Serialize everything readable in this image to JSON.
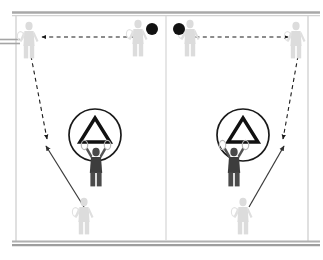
{
  "diagram": {
    "court": {
      "outline_color": "#bdbdbd",
      "boundary_color": "#9a9a9a",
      "top_line_y": 14,
      "bottom_line_y": 241,
      "left_x": 16,
      "right_x": 308,
      "center_line_x": 166,
      "net_stub_y": 41,
      "net_stub_x_end": 20
    },
    "logo": {
      "name": "circle-triangle-logo",
      "shape": "circle-with-hollow-triangle",
      "stroke_color": "#111111",
      "instances": [
        {
          "cx": 95,
          "cy": 135,
          "r": 26
        },
        {
          "cx": 243,
          "cy": 135,
          "r": 26
        }
      ]
    },
    "balls": [
      {
        "name": "ball-left",
        "cx": 152,
        "cy": 29,
        "r": 6,
        "color": "#121212"
      },
      {
        "name": "ball-right",
        "cx": 179,
        "cy": 29,
        "r": 6,
        "color": "#121212"
      }
    ],
    "players": [
      {
        "name": "player-rear-left",
        "x": 29,
        "y": 40,
        "shade": "light",
        "role": "receiver-rear-left"
      },
      {
        "name": "player-front-left",
        "x": 138,
        "y": 38,
        "shade": "light",
        "role": "feeder-left"
      },
      {
        "name": "player-front-right",
        "x": 190,
        "y": 38,
        "shade": "light",
        "role": "feeder-right"
      },
      {
        "name": "player-rear-right",
        "x": 296,
        "y": 40,
        "shade": "light",
        "role": "receiver-rear-right"
      },
      {
        "name": "player-mid-left",
        "x": 96,
        "y": 163,
        "shade": "dark",
        "role": "net-player-left"
      },
      {
        "name": "player-mid-right",
        "x": 234,
        "y": 163,
        "shade": "dark",
        "role": "net-player-right"
      },
      {
        "name": "player-base-left",
        "x": 84,
        "y": 213,
        "shade": "light",
        "role": "base-player-left"
      },
      {
        "name": "player-base-right",
        "x": 243,
        "y": 213,
        "shade": "light",
        "role": "base-player-right"
      }
    ],
    "arrows": {
      "dashed_color": "#1b1b1b",
      "solid_color": "#3a3a3a",
      "paths": [
        {
          "name": "shuttle-path-top-left",
          "style": "dashed",
          "x1": 142,
          "y1": 37,
          "x2": 42,
          "y2": 37,
          "label": "cross-court clear to rear left"
        },
        {
          "name": "shuttle-path-top-right",
          "style": "dashed",
          "x1": 188,
          "y1": 37,
          "x2": 288,
          "y2": 37,
          "label": "cross-court clear to rear right"
        },
        {
          "name": "shuttle-path-drop-left",
          "style": "dashed",
          "x1": 31,
          "y1": 56,
          "x2": 48,
          "y2": 140,
          "label": "drop toward midcourt left"
        },
        {
          "name": "shuttle-path-drop-right",
          "style": "dashed",
          "x1": 298,
          "y1": 56,
          "x2": 282,
          "y2": 140,
          "label": "drop toward midcourt right"
        },
        {
          "name": "movement-path-left",
          "style": "solid",
          "x1": 84,
          "y1": 207,
          "x2": 46,
          "y2": 145,
          "label": "player run to midcourt left"
        },
        {
          "name": "movement-path-right",
          "style": "solid",
          "x1": 248,
          "y1": 207,
          "x2": 284,
          "y2": 145,
          "label": "player run to midcourt right"
        }
      ]
    },
    "legend": {
      "dashed_meaning": "shuttle trajectory",
      "solid_meaning": "player movement"
    }
  }
}
